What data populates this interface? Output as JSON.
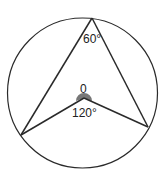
{
  "diagram": {
    "title": "",
    "type": "circle-theorem",
    "colors": {
      "stroke": "#2a2a2a",
      "sector_fill": "#777777",
      "text": "#222222",
      "background": "#ffffff"
    },
    "labels": {
      "apex_angle": "60°",
      "center": "0",
      "center_angle": "120°"
    }
  }
}
